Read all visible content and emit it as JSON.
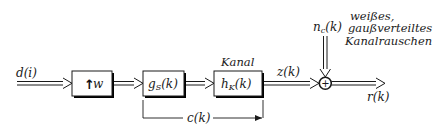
{
  "diagram": {
    "type": "block-diagram",
    "signals": {
      "input": "d(i)",
      "channel_output": "z(k)",
      "noise": "n",
      "noise_sub": "c",
      "noise_arg": "(k)",
      "output": "r(k)",
      "combined": "c(k)"
    },
    "blocks": [
      {
        "id": "upsampler",
        "symbol": "↑",
        "label": "w"
      },
      {
        "id": "transmit-filter",
        "label": "g",
        "sub": "S",
        "arg": "(k)"
      },
      {
        "id": "channel",
        "label": "h",
        "sub": "K",
        "arg": "(k)",
        "caption": "Kanal"
      }
    ],
    "summing_junction": {
      "symbol": "+"
    },
    "noise_description": [
      "weißes,",
      "gaußverteiltes",
      "Kanalrauschen"
    ],
    "colors": {
      "line": "#1a1a1a",
      "background": "#ffffff",
      "shadow": "#000000"
    }
  }
}
